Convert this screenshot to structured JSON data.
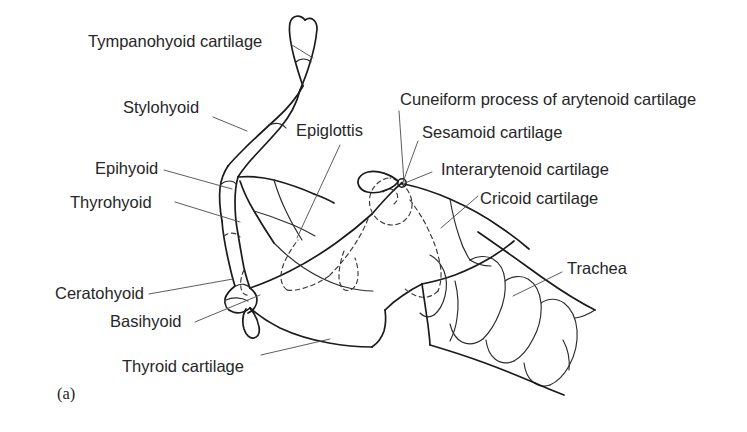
{
  "figure": {
    "panel_letter": "(a)",
    "background_color": "#ffffff",
    "ink_color": "#1b1b1b",
    "text_color": "#262626",
    "width": 747,
    "height": 432
  },
  "labels": {
    "tympanohyoid": "Tympanohyoid cartilage",
    "stylohyoid": "Stylohyoid",
    "epihyoid": "Epihyoid",
    "thyrohyoid": "Thyrohyoid",
    "ceratohyoid": "Ceratohyoid",
    "basihyoid": "Basihyoid",
    "thyroid_cartilage": "Thyroid cartilage",
    "epiglottis": "Epiglottis",
    "cuneiform": "Cuneiform process of arytenoid cartilage",
    "sesamoid": "Sesamoid cartilage",
    "interarytenoid": "Interarytenoid cartilage",
    "cricoid": "Cricoid cartilage",
    "trachea": "Trachea"
  }
}
